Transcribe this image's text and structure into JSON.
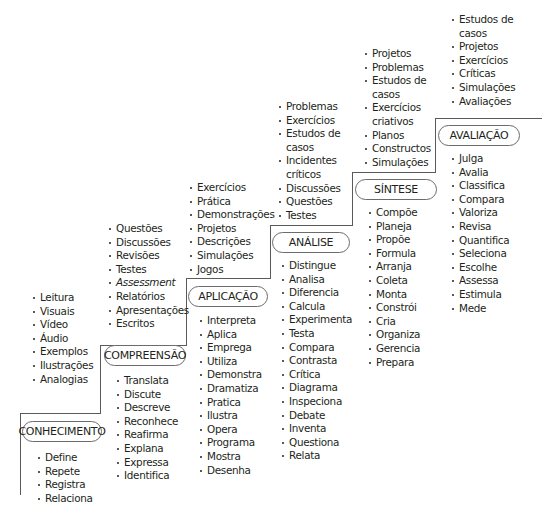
{
  "diagram": {
    "type": "staircase",
    "levels": [
      {
        "id": "conhecimento",
        "label": "CONHECIMENTO",
        "activities": [
          "Leitura",
          "Visuais",
          "Vídeo",
          "Áudio",
          "Exemplos",
          "Ilustrações",
          "Analogias"
        ],
        "verbs": [
          "Define",
          "Repete",
          "Registra",
          "Relaciona"
        ]
      },
      {
        "id": "compreensao",
        "label": "COMPREENSÃO",
        "activities": [
          "Questões",
          "Discussões",
          "Revisões",
          "Testes",
          "Assessment",
          "Relatórios",
          "Apresentações",
          "Escritos"
        ],
        "verbs": [
          "Translata",
          "Discute",
          "Descreve",
          "Reconhece",
          "Reafirma",
          "Explana",
          "Expressa",
          "Identifica"
        ]
      },
      {
        "id": "aplicacao",
        "label": "APLICAÇÃO",
        "activities": [
          "Exercícios",
          "Prática",
          "Demonstrações",
          "Projetos",
          "Descrições",
          "Simulações",
          "Jogos"
        ],
        "verbs": [
          "Interpreta",
          "Aplica",
          "Emprega",
          "Utiliza",
          "Demonstra",
          "Dramatiza",
          "Pratica",
          "Ilustra",
          "Opera",
          "Programa",
          "Mostra",
          "Desenha"
        ]
      },
      {
        "id": "analise",
        "label": "ANÁLISE",
        "activities": [
          "Problemas",
          "Exercícios",
          "Estudos de",
          "casos",
          "Incidentes",
          "críticos",
          "Discussões",
          "Questões",
          "Testes"
        ],
        "verbs": [
          "Distingue",
          "Analisa",
          "Diferencia",
          "Calcula",
          "Experimenta",
          "Testa",
          "Compara",
          "Contrasta",
          "Crítica",
          "Diagrama",
          "Inspeciona",
          "Debate",
          "Inventa",
          "Questiona",
          "Relata"
        ]
      },
      {
        "id": "sintese",
        "label": "SÍNTESE",
        "activities": [
          "Projetos",
          "Problemas",
          "Estudos de",
          "casos",
          "Exercícios",
          "criativos",
          "Planos",
          "Constructos",
          "Simulações"
        ],
        "verbs": [
          "Compõe",
          "Planeja",
          "Propõe",
          "Formula",
          "Arranja",
          "Coleta",
          "Monta",
          "Constrói",
          "Cria",
          "Organiza",
          "Gerencia",
          "Prepara"
        ]
      },
      {
        "id": "avaliacao",
        "label": "AVALIAÇÃO",
        "activities": [
          "Estudos de",
          "casos",
          "Projetos",
          "Exercícios",
          "Críticas",
          "Simulações",
          "Avaliações"
        ],
        "verbs": [
          "Julga",
          "Avalia",
          "Classifica",
          "Compara",
          "Valoriza",
          "Revisa",
          "Quantifica",
          "Seleciona",
          "Escolhe",
          "Assessa",
          "Estimula",
          "Mede"
        ]
      }
    ],
    "colors": {
      "text": "#231f20",
      "lines": "#5a5a5a",
      "pill_border": "#6b6b6b"
    }
  }
}
